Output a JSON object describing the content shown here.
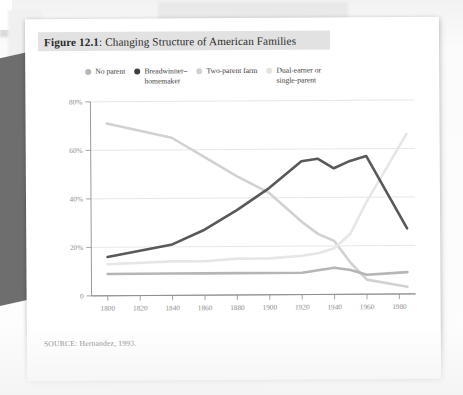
{
  "figure": {
    "label": "Figure 12.1",
    "separator": ":",
    "title": "Changing Structure of American Families",
    "source": "SOURCE: Hernandez, 1993."
  },
  "legend": {
    "position": "top",
    "items": [
      {
        "label": "No parent",
        "color": "#b5b5b5"
      },
      {
        "label": "Breadwinner–\nhomemaker",
        "color": "#3f3f3f"
      },
      {
        "label": "Two-parent farm",
        "color": "#d2d2d2"
      },
      {
        "label": "Dual-earner or\nsingle-parent",
        "color": "#e3e3e3"
      }
    ]
  },
  "chart_data": {
    "type": "line",
    "title": "Changing Structure of American Families",
    "xlabel": "",
    "ylabel": "",
    "xlim": [
      1790,
      1990
    ],
    "ylim": [
      0,
      80
    ],
    "xticks": [
      1800,
      1820,
      1840,
      1860,
      1880,
      1900,
      1920,
      1940,
      1960,
      1980
    ],
    "yticks": [
      0,
      20,
      40,
      60,
      80
    ],
    "ytick_labels": [
      "0",
      "20%",
      "40%",
      "60%",
      "80%"
    ],
    "grid": "horizontal",
    "x": [
      1800,
      1840,
      1860,
      1880,
      1900,
      1920,
      1930,
      1940,
      1950,
      1960,
      1985
    ],
    "series": [
      {
        "name": "Two-parent farm",
        "color": "#d2d2d2",
        "values": [
          71,
          65,
          57,
          49,
          42,
          30,
          25,
          22,
          13,
          6,
          3
        ]
      },
      {
        "name": "Breadwinner–homemaker",
        "color": "#595959",
        "values": [
          16,
          21,
          27,
          35,
          44,
          55,
          56,
          52,
          55,
          57,
          27
        ]
      },
      {
        "name": "Dual-earner or single-parent",
        "color": "#e6e6e6",
        "values": [
          13,
          14,
          14,
          15,
          15,
          16,
          17,
          19,
          25,
          38,
          66
        ]
      },
      {
        "name": "No parent",
        "color": "#b5b5b5",
        "values": [
          9,
          9,
          9,
          9,
          9,
          9,
          10,
          11,
          10,
          8,
          9
        ]
      }
    ]
  }
}
